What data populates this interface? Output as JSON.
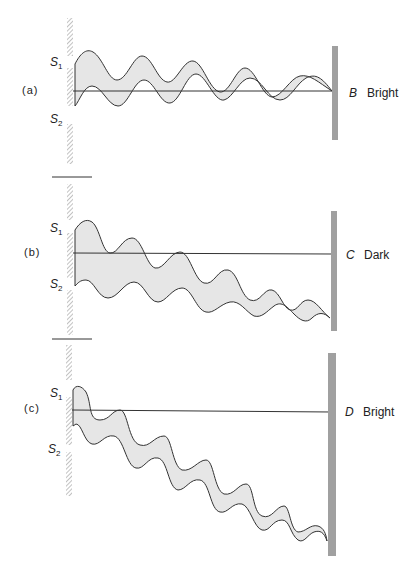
{
  "panels": [
    {
      "id": "a",
      "label": "(a)",
      "s1": "S",
      "s1_sub": "1",
      "s2": "S",
      "s2_sub": "2",
      "point": "B",
      "result": "Bright"
    },
    {
      "id": "b",
      "label": "(b)",
      "s1": "S",
      "s1_sub": "1",
      "s2": "S",
      "s2_sub": "2",
      "point": "C",
      "result": "Dark"
    },
    {
      "id": "c",
      "label": "(c)",
      "s1": "S",
      "s1_sub": "1",
      "s2": "S",
      "s2_sub": "2",
      "point": "D",
      "result": "Bright"
    }
  ],
  "colors": {
    "wave_fill": "#e6e6e6",
    "wave_line": "#333333",
    "screen": "#a0a0a0",
    "barrier_hatch": "#aaaaaa"
  }
}
